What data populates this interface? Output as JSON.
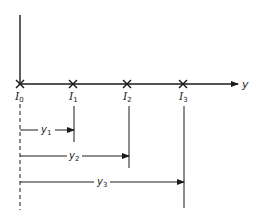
{
  "diagram": {
    "axis_label": "y",
    "points": [
      {
        "name": "I",
        "sub": "0",
        "x": 20
      },
      {
        "name": "I",
        "sub": "1",
        "x": 73
      },
      {
        "name": "I",
        "sub": "2",
        "x": 127
      },
      {
        "name": "I",
        "sub": "3",
        "x": 183
      }
    ],
    "distances": [
      {
        "name": "y",
        "sub": "1",
        "to": "I1"
      },
      {
        "name": "y",
        "sub": "2",
        "to": "I2"
      },
      {
        "name": "y",
        "sub": "3",
        "to": "I3"
      }
    ],
    "colors": {
      "line": "#1a1a1a",
      "background": "#ffffff"
    }
  }
}
